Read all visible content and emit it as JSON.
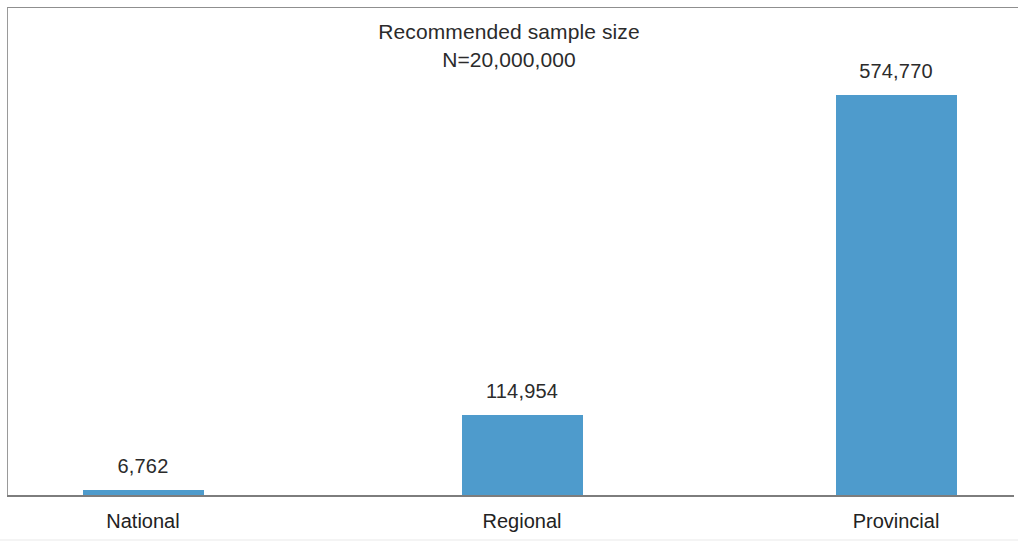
{
  "chart_data": {
    "type": "bar",
    "title": "Recommended sample size",
    "subtitle": "N=20,000,000",
    "xlabel": "",
    "ylabel": "",
    "categories": [
      "National",
      "Regional",
      "Provincial"
    ],
    "values": [
      6762,
      114954,
      574770
    ],
    "value_labels": [
      "6,762",
      "114,954",
      "574,770"
    ],
    "ylim": [
      0,
      574770
    ],
    "grid": false,
    "legend": false,
    "legend_position": "none",
    "series": [
      {
        "name": "Recommended sample size",
        "values": [
          6762,
          114954,
          574770
        ]
      }
    ],
    "colors": {
      "bar": "#4e9bcc",
      "text": "#2b2b2b",
      "axis": "#7d7d7d",
      "frame": "#9a9a9a",
      "background": "#ffffff"
    }
  },
  "axis": {
    "baseline_name": "category-axis"
  }
}
